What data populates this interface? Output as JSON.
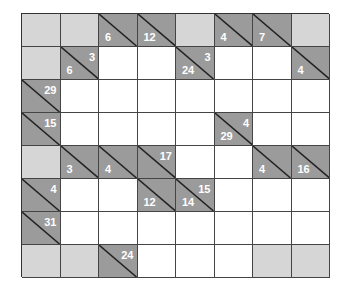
{
  "puzzle": {
    "type": "kakuro",
    "rows": 8,
    "cols": 8,
    "colors": {
      "clue": "#9b9b9b",
      "blank": "#d6d6d6",
      "white": "#ffffff",
      "digit": "#ffffff",
      "line": "#444444"
    },
    "grid": [
      [
        {
          "t": "blank"
        },
        {
          "t": "blank"
        },
        {
          "t": "clue",
          "down": "6"
        },
        {
          "t": "clue",
          "down": "12"
        },
        {
          "t": "blank"
        },
        {
          "t": "clue",
          "down": "4"
        },
        {
          "t": "clue",
          "down": "7"
        },
        {
          "t": "blank"
        }
      ],
      [
        {
          "t": "blank"
        },
        {
          "t": "clue",
          "across": "3",
          "down": "6"
        },
        {
          "t": "white"
        },
        {
          "t": "white"
        },
        {
          "t": "clue",
          "across": "3",
          "down": "24"
        },
        {
          "t": "white"
        },
        {
          "t": "white"
        },
        {
          "t": "clue",
          "down": "4"
        }
      ],
      [
        {
          "t": "clue",
          "across": "29"
        },
        {
          "t": "white"
        },
        {
          "t": "white"
        },
        {
          "t": "white"
        },
        {
          "t": "white"
        },
        {
          "t": "white"
        },
        {
          "t": "white"
        },
        {
          "t": "white"
        }
      ],
      [
        {
          "t": "clue",
          "across": "15"
        },
        {
          "t": "white"
        },
        {
          "t": "white"
        },
        {
          "t": "white"
        },
        {
          "t": "white"
        },
        {
          "t": "clue",
          "across": "4",
          "down": "29"
        },
        {
          "t": "white"
        },
        {
          "t": "white"
        }
      ],
      [
        {
          "t": "blank"
        },
        {
          "t": "clue",
          "down": "3"
        },
        {
          "t": "clue",
          "down": "4"
        },
        {
          "t": "clue",
          "across": "17"
        },
        {
          "t": "white"
        },
        {
          "t": "white"
        },
        {
          "t": "clue",
          "down": "4"
        },
        {
          "t": "clue",
          "down": "16"
        }
      ],
      [
        {
          "t": "clue",
          "across": "4"
        },
        {
          "t": "white"
        },
        {
          "t": "white"
        },
        {
          "t": "clue",
          "down": "12"
        },
        {
          "t": "clue",
          "across": "15",
          "down": "14"
        },
        {
          "t": "white"
        },
        {
          "t": "white"
        },
        {
          "t": "white"
        }
      ],
      [
        {
          "t": "clue",
          "across": "31"
        },
        {
          "t": "white"
        },
        {
          "t": "white"
        },
        {
          "t": "white"
        },
        {
          "t": "white"
        },
        {
          "t": "white"
        },
        {
          "t": "white"
        },
        {
          "t": "white"
        }
      ],
      [
        {
          "t": "blank"
        },
        {
          "t": "blank"
        },
        {
          "t": "clue",
          "across": "24"
        },
        {
          "t": "white"
        },
        {
          "t": "white"
        },
        {
          "t": "white"
        },
        {
          "t": "blank"
        },
        {
          "t": "blank"
        }
      ]
    ]
  }
}
